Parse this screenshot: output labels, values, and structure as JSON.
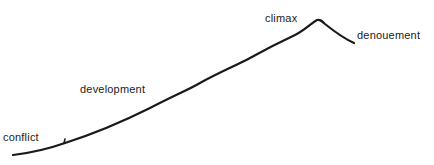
{
  "diagram": {
    "type": "plot-arc",
    "labels": {
      "conflict": "conflict",
      "development": "development",
      "climax": "climax",
      "denouement": "denouement"
    },
    "line_color": "#1a1a1a",
    "text_color": "#222222"
  }
}
